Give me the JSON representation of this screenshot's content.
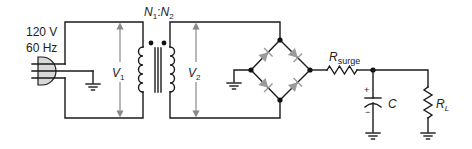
{
  "diagram": {
    "source": {
      "voltage_label": "120 V",
      "frequency_label": "60 Hz",
      "icon": "ac-plug-icon"
    },
    "transformer": {
      "ratio_label_n1": "N",
      "ratio_label_n1_sub": "1",
      "ratio_sep": ":",
      "ratio_label_n2": "N",
      "ratio_label_n2_sub": "2",
      "primary_voltage": "V",
      "primary_voltage_sub": "1",
      "secondary_voltage": "V",
      "secondary_voltage_sub": "2"
    },
    "bridge": {
      "diodes": 4,
      "diode_color": "#9a9a9a"
    },
    "surge_resistor": {
      "label": "R",
      "label_sub": "surge"
    },
    "capacitor": {
      "label": "C",
      "plus": "+",
      "minus": "−"
    },
    "load_resistor": {
      "label": "R",
      "label_sub": "L"
    },
    "colors": {
      "wire": "#1a1a1a",
      "arrow": "#8a8a8a",
      "background": "#ffffff"
    }
  }
}
